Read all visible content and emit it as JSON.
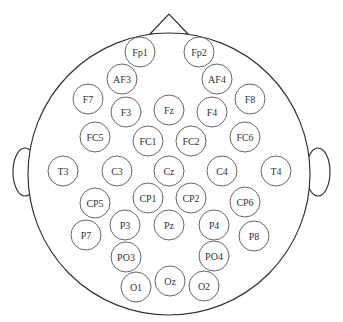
{
  "diagram": {
    "type": "eeg-electrode-montage",
    "head": {
      "cx": 169,
      "cy": 174,
      "r": 141
    },
    "nose": {
      "apex": [
        169,
        14
      ],
      "left": [
        150,
        34
      ],
      "right": [
        188,
        34
      ]
    },
    "ears": {
      "left": {
        "cx": 25,
        "cy": 172,
        "rx": 12,
        "ry": 24
      },
      "right": {
        "cx": 318,
        "cy": 172,
        "rx": 12,
        "ry": 24
      }
    },
    "electrode_radius": 15,
    "electrodes": [
      {
        "label": "Fp1",
        "x": 140,
        "y": 52
      },
      {
        "label": "Fp2",
        "x": 199,
        "y": 52
      },
      {
        "label": "AF3",
        "x": 122,
        "y": 79
      },
      {
        "label": "AF4",
        "x": 217,
        "y": 79
      },
      {
        "label": "F7",
        "x": 88,
        "y": 99
      },
      {
        "label": "F3",
        "x": 126,
        "y": 112
      },
      {
        "label": "Fz",
        "x": 169,
        "y": 110
      },
      {
        "label": "F4",
        "x": 212,
        "y": 112
      },
      {
        "label": "F8",
        "x": 250,
        "y": 99
      },
      {
        "label": "FC5",
        "x": 95,
        "y": 137
      },
      {
        "label": "FC1",
        "x": 148,
        "y": 141
      },
      {
        "label": "FC2",
        "x": 191,
        "y": 141
      },
      {
        "label": "FC6",
        "x": 245,
        "y": 137
      },
      {
        "label": "T3",
        "x": 63,
        "y": 171
      },
      {
        "label": "C3",
        "x": 117,
        "y": 171
      },
      {
        "label": "Cz",
        "x": 169,
        "y": 171
      },
      {
        "label": "C4",
        "x": 222,
        "y": 171
      },
      {
        "label": "T4",
        "x": 276,
        "y": 171
      },
      {
        "label": "CP5",
        "x": 95,
        "y": 203
      },
      {
        "label": "CP1",
        "x": 148,
        "y": 198
      },
      {
        "label": "CP2",
        "x": 191,
        "y": 198
      },
      {
        "label": "CP6",
        "x": 245,
        "y": 202
      },
      {
        "label": "P7",
        "x": 86,
        "y": 235
      },
      {
        "label": "P3",
        "x": 125,
        "y": 225
      },
      {
        "label": "Pz",
        "x": 169,
        "y": 225
      },
      {
        "label": "P4",
        "x": 214,
        "y": 225
      },
      {
        "label": "P8",
        "x": 254,
        "y": 236
      },
      {
        "label": "PO3",
        "x": 126,
        "y": 257
      },
      {
        "label": "PO4",
        "x": 214,
        "y": 256
      },
      {
        "label": "O1",
        "x": 136,
        "y": 287
      },
      {
        "label": "Oz",
        "x": 170,
        "y": 281
      },
      {
        "label": "O2",
        "x": 204,
        "y": 286
      }
    ],
    "colors": {
      "outline": "#333333",
      "electrode_stroke": "#555555",
      "text": "#333333",
      "background": "#ffffff"
    }
  }
}
